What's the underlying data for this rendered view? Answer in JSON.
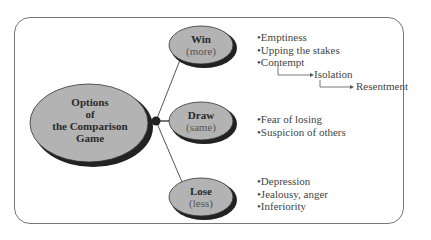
{
  "center": {
    "lines": [
      "Options",
      "of",
      "the Comparison",
      "Game"
    ]
  },
  "branches": [
    {
      "title": "Win",
      "subtitle": "(more)",
      "items": [
        "Emptiness",
        "Upping the stakes",
        "Contempt"
      ],
      "chain": [
        "Isolation",
        "Resentment"
      ]
    },
    {
      "title": "Draw",
      "subtitle": "(same)",
      "items": [
        "Fear of losing",
        "Suspicion of others"
      ]
    },
    {
      "title": "Lose",
      "subtitle": "(less)",
      "items": [
        "Depression",
        "Jealousy, anger",
        "Inferiority"
      ]
    }
  ],
  "colors": {
    "ellipse_fill": "#b3b3b3",
    "shadow": "#222222",
    "line": "#555555"
  }
}
